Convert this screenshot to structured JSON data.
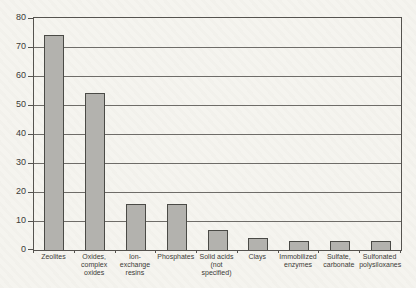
{
  "chart_data": {
    "type": "bar",
    "title": "",
    "xlabel": "",
    "ylabel": "",
    "categories": [
      "Zeolites",
      "Oxides,\ncomplex\noxides",
      "Ion-exchange\nresins",
      "Phosphates",
      "Solid acids\n(not specified)",
      "Clays",
      "Immobilized\nenzymes",
      "Sulfate,\ncarbonate",
      "Sulfonated\npolysiloxanes"
    ],
    "values": [
      74,
      54,
      16,
      16,
      7,
      4,
      3,
      3,
      3
    ],
    "ylim": [
      0,
      80
    ],
    "yticks": [
      0,
      10,
      20,
      30,
      40,
      50,
      60,
      70,
      80
    ],
    "grid": true,
    "legend": "none",
    "colors": {
      "bar_fill": "#b3b2ae",
      "bar_border": "#4a4a46",
      "gridline": "#6e6c68",
      "axis": "#55534f",
      "text": "#3c3b38",
      "paper_background": "#f5f4ef"
    }
  }
}
